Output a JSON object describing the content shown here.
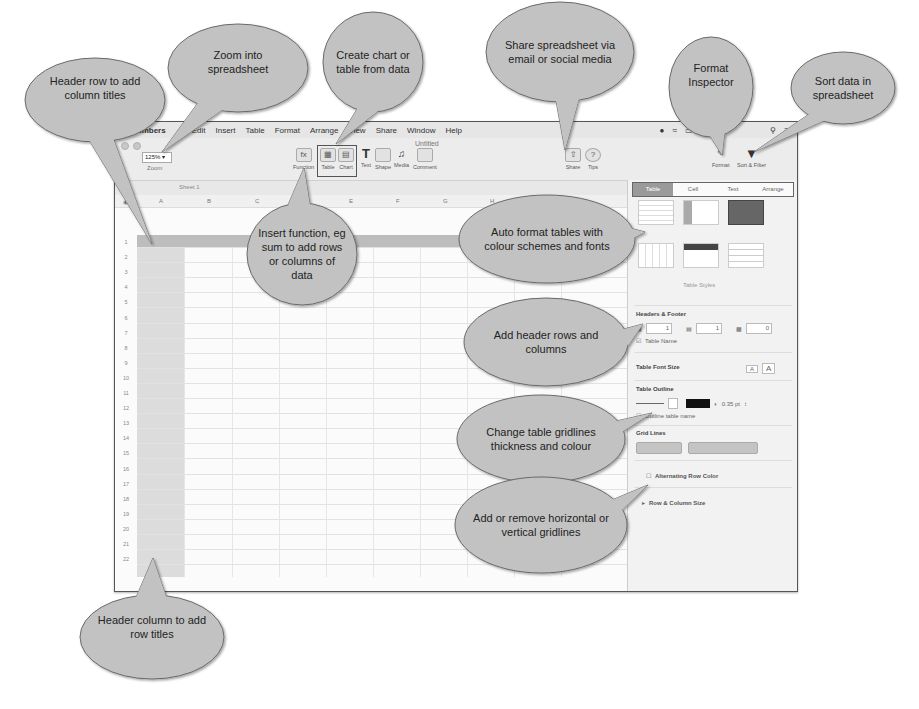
{
  "menubar": {
    "apple_icon": "apple-icon",
    "items": [
      "Numbers",
      "Edit",
      "Insert",
      "Table",
      "Format",
      "Arrange",
      "View",
      "Share",
      "Window",
      "Help"
    ],
    "clock": "Tue",
    "status_icons": [
      "user-icon",
      "wifi-icon",
      "battery-icon",
      "search-icon",
      "list-icon"
    ]
  },
  "window": {
    "title": "Untitled"
  },
  "toolbar": {
    "zoom_value": "125%",
    "zoom_label": "Zoom",
    "buttons": [
      {
        "label": "Function",
        "icon": "function-icon"
      },
      {
        "label": "Table",
        "icon": "table-icon"
      },
      {
        "label": "Chart",
        "icon": "chart-icon"
      },
      {
        "label": "Text",
        "icon": "text-icon"
      },
      {
        "label": "Shape",
        "icon": "shape-icon"
      },
      {
        "label": "Media",
        "icon": "media-icon"
      },
      {
        "label": "Comment",
        "icon": "comment-icon"
      },
      {
        "label": "Share",
        "icon": "share-icon"
      },
      {
        "label": "Tips",
        "icon": "tips-icon"
      },
      {
        "label": "Format",
        "icon": "format-icon"
      },
      {
        "label": "Sort & Filter",
        "icon": "filter-icon"
      }
    ]
  },
  "sheet": {
    "tab_label": "Sheet 1",
    "columns": [
      "A",
      "B",
      "C",
      "D",
      "E",
      "F",
      "G",
      "H"
    ],
    "rows": [
      "1",
      "2",
      "3",
      "4",
      "5",
      "6",
      "7",
      "8",
      "9",
      "10",
      "11",
      "12",
      "13",
      "14",
      "15",
      "16",
      "17",
      "18",
      "19",
      "20",
      "21",
      "22"
    ]
  },
  "inspector": {
    "tabs": [
      "Table",
      "Cell",
      "Text",
      "Arrange"
    ],
    "active_tab": "Table",
    "table_styles_label": "Table Styles",
    "headers_footer_label": "Headers & Footer",
    "header_rows": "1",
    "header_cols": "1",
    "footer_rows": "0",
    "table_name_label": "Table Name",
    "table_font_size_label": "Table Font Size",
    "font_small": "A",
    "font_large": "A",
    "table_outline_label": "Table Outline",
    "outline_width": "0.35 pt",
    "outline_table_name_label": "Outline table name",
    "grid_lines_label": "Grid Lines",
    "alternating_row_color_label": "Alternating Row Color",
    "row_col_size_label": "Row & Column Size"
  },
  "callouts": {
    "header_row": "Header row to add column titles",
    "zoom": "Zoom into spreadsheet",
    "create_chart": "Create chart or table from data",
    "share": "Share spreadsheet via email or social media",
    "format_inspector": "Format Inspector",
    "sort_data": "Sort data in spreadsheet",
    "insert_function": "Insert function, eg sum to add rows or columns of data",
    "auto_format": "Auto format tables with colour schemes and fonts",
    "add_header": "Add header rows and columns",
    "change_gridlines": "Change table gridlines thickness and colour",
    "add_remove_gridlines": "Add or remove horizontal or vertical gridlines",
    "header_column": "Header column to add row titles"
  },
  "colors": {
    "callout_fill": "#c2c2c2",
    "callout_stroke": "#6a6a6a",
    "header_row_fill": "#bdbdbd",
    "header_col_fill": "#dcdcdc",
    "active_tab_fill": "#9a9a9a"
  }
}
